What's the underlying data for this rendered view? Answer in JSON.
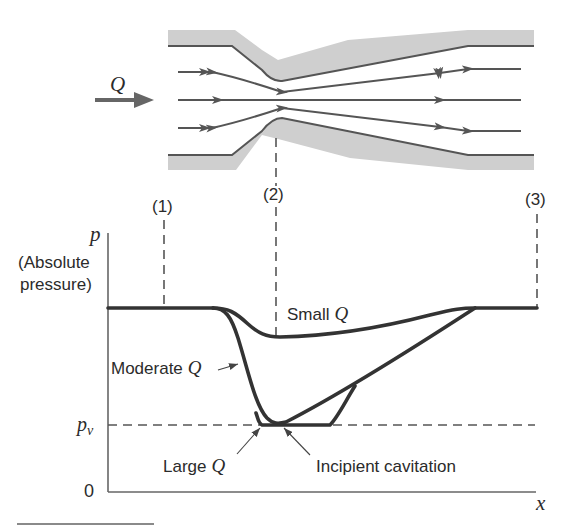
{
  "figure": {
    "flow_label": "Q",
    "stations": {
      "s1": "(1)",
      "s2": "(2)",
      "s3": "(3)"
    },
    "y_axis": {
      "symbol": "p",
      "label_line1": "(Absolute",
      "label_line2": "pressure)",
      "origin": "0"
    },
    "x_axis": {
      "symbol": "x"
    },
    "vapor_pressure": {
      "symbol": "p",
      "subscript": "v"
    },
    "curves": [
      {
        "name": "Small",
        "q": "Q"
      },
      {
        "name": "Moderate",
        "q": "Q"
      },
      {
        "name": "Large",
        "q": "Q"
      }
    ],
    "annotation": "Incipient cavitation"
  },
  "colors": {
    "wall_fill": "#cfcfcf",
    "lines": "#333333",
    "background": "#ffffff"
  }
}
